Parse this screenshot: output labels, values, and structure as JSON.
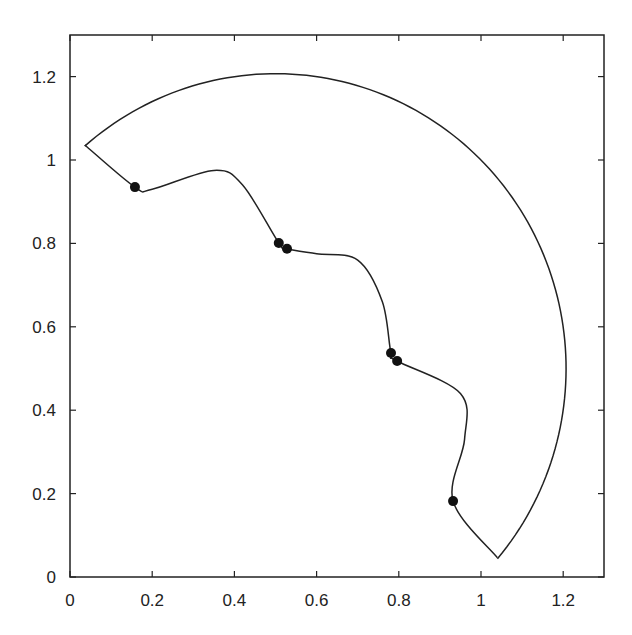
{
  "chart_data": {
    "type": "line",
    "title": "",
    "xlabel": "",
    "ylabel": "",
    "xlim": [
      0,
      1.3
    ],
    "ylim": [
      0,
      1.3
    ],
    "grid": false,
    "legend": null,
    "x_ticks": [
      "0",
      "0.2",
      "0.4",
      "0.6",
      "0.8",
      "1",
      "1.2"
    ],
    "y_ticks": [
      "0",
      "0.2",
      "0.4",
      "0.6",
      "0.8",
      "1",
      "1.2"
    ],
    "series": [
      {
        "name": "outer-arc",
        "description": "circular arc centered near (0.5, 0.5), radius ~0.71, from left cusp to bottom cusp",
        "points": [
          [
            0.036,
            1.036
          ],
          [
            0.2,
            1.13
          ],
          [
            0.5,
            1.206
          ],
          [
            0.8,
            1.14
          ],
          [
            1.0,
            0.98
          ],
          [
            1.15,
            0.75
          ],
          [
            1.206,
            0.5
          ],
          [
            1.17,
            0.28
          ],
          [
            1.04,
            0.046
          ]
        ]
      },
      {
        "name": "inner-wavy-curve",
        "points": [
          [
            0.036,
            1.036
          ],
          [
            0.158,
            0.935
          ],
          [
            0.2,
            0.93
          ],
          [
            0.35,
            0.975
          ],
          [
            0.42,
            0.94
          ],
          [
            0.508,
            0.801
          ],
          [
            0.528,
            0.787
          ],
          [
            0.6,
            0.775
          ],
          [
            0.7,
            0.76
          ],
          [
            0.76,
            0.66
          ],
          [
            0.781,
            0.537
          ],
          [
            0.796,
            0.518
          ],
          [
            0.95,
            0.44
          ],
          [
            0.96,
            0.33
          ],
          [
            0.932,
            0.182
          ],
          [
            1.04,
            0.046
          ]
        ]
      },
      {
        "name": "markers",
        "type": "scatter",
        "points": [
          [
            0.158,
            0.935
          ],
          [
            0.508,
            0.801
          ],
          [
            0.528,
            0.787
          ],
          [
            0.781,
            0.537
          ],
          [
            0.796,
            0.518
          ],
          [
            0.932,
            0.182
          ]
        ]
      }
    ]
  }
}
